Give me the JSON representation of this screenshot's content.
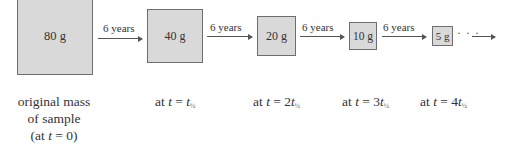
{
  "diagram": {
    "fill_color": "#d9d9d9",
    "border_color": "#6e6e6e",
    "boxes": [
      {
        "mass": "80 g"
      },
      {
        "mass": "40 g"
      },
      {
        "mass": "20 g"
      },
      {
        "mass": "10 g"
      },
      {
        "mass": "5 g"
      }
    ],
    "arrows": [
      {
        "label": "6 years"
      },
      {
        "label": "6 years"
      },
      {
        "label": "6 years"
      },
      {
        "label": "6 years"
      }
    ],
    "continuation": "· · ·",
    "captions": [
      {
        "line1": "original mass",
        "line2": "of sample",
        "line3_prefix": "(at ",
        "var": "t",
        "line3_suffix": " = 0)"
      },
      {
        "prefix": "at ",
        "var": "t",
        "eq": " = ",
        "coef": "",
        "var2": "t",
        "sub": "½"
      },
      {
        "prefix": "at ",
        "var": "t",
        "eq": " = ",
        "coef": "2",
        "var2": "t",
        "sub": "½"
      },
      {
        "prefix": "at ",
        "var": "t",
        "eq": " = ",
        "coef": "3",
        "var2": "t",
        "sub": "½"
      },
      {
        "prefix": "at ",
        "var": "t",
        "eq": " = ",
        "coef": "4",
        "var2": "t",
        "sub": "½"
      }
    ]
  }
}
